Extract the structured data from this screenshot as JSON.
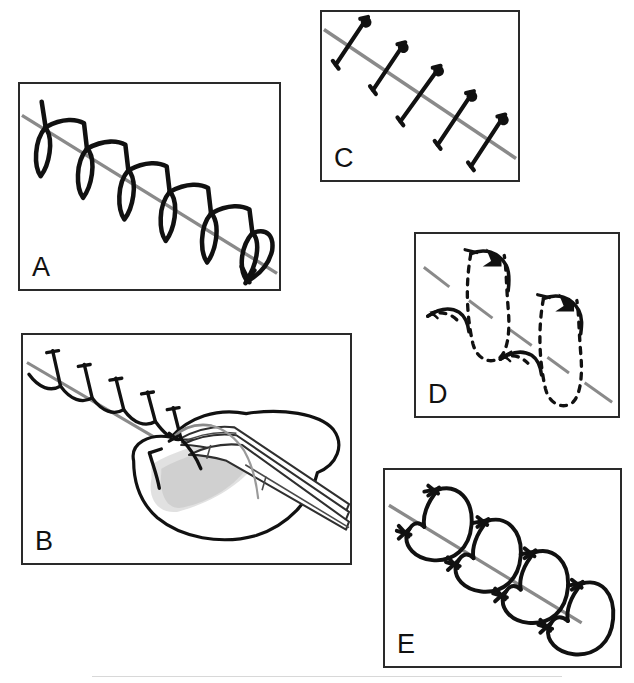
{
  "figure": {
    "type": "medical-illustration",
    "background_color": "#ffffff",
    "width": 634,
    "height": 683
  },
  "colors": {
    "panel_border": "#2a2a2a",
    "suture_black": "#111111",
    "incision_gray": "#8a8a8a",
    "tissue_gray": "#b8b8b8",
    "tissue_light": "#d9d9d9",
    "instrument_gray": "#9a9a9a",
    "background": "#ffffff"
  },
  "panels": [
    {
      "id": "A",
      "label": "A",
      "name": "panel-a-continuous-running-suture",
      "description": "Continuous running suture with oblique loops crossing the incision line",
      "technique": "Continuous running suture",
      "x": 18,
      "y": 82,
      "width": 263,
      "height": 209,
      "loop_count": 6,
      "incision_line_style": "solid-gray"
    },
    {
      "id": "B",
      "label": "B",
      "name": "panel-b-continuous-suture-with-forceps",
      "description": "Continuous suture line with thumb forceps grasping everted tissue edge",
      "technique": "Continuous suture with tissue forceps",
      "x": 21,
      "y": 333,
      "width": 331,
      "height": 232,
      "loop_count": 6,
      "incision_line_style": "solid-gray"
    },
    {
      "id": "C",
      "label": "C",
      "name": "panel-c-simple-interrupted-suture",
      "description": "Simple interrupted sutures placed perpendicular across the incision line",
      "technique": "Simple interrupted suture",
      "x": 320,
      "y": 10,
      "width": 200,
      "height": 172,
      "loop_count": 5,
      "incision_line_style": "solid-gray"
    },
    {
      "id": "D",
      "label": "D",
      "name": "panel-d-buried-subcuticular-suture",
      "description": "Buried subcuticular suture with dashed buried passes and solid arrowed surface segments",
      "technique": "Buried subcuticular suture",
      "x": 414,
      "y": 232,
      "width": 206,
      "height": 186,
      "loop_count": 2,
      "incision_line_style": "dashed-gray-segments"
    },
    {
      "id": "E",
      "label": "E",
      "name": "panel-e-cruciate-mattress-suture",
      "description": "Cruciate / horizontal mattress sutures forming overlapping arcs across the incision",
      "technique": "Cruciate mattress suture",
      "x": 383,
      "y": 468,
      "width": 239,
      "height": 200,
      "loop_count": 4,
      "incision_line_style": "solid-gray"
    }
  ]
}
